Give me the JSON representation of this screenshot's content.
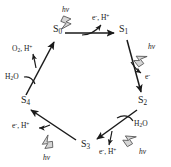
{
  "diagram": {
    "states": [
      {
        "id": "S0",
        "label": "S",
        "subscript": "0",
        "x": 53,
        "y": 30
      },
      {
        "id": "S1",
        "label": "S",
        "subscript": "1",
        "x": 119,
        "y": 30
      },
      {
        "id": "S2",
        "label": "S",
        "subscript": "2",
        "x": 138,
        "y": 100
      },
      {
        "id": "S3",
        "label": "S",
        "subscript": "3",
        "x": 81,
        "y": 142
      },
      {
        "id": "S4",
        "label": "S",
        "subscript": "4",
        "x": 21,
        "y": 100
      }
    ],
    "species": [
      {
        "id": "products-s0-s1",
        "text": "e⁻, H⁺",
        "base": "e",
        "sup1": "-",
        "mid": ", H",
        "sup2": "+",
        "x": 92,
        "y": 18
      },
      {
        "id": "product-s1-s2",
        "text": "e⁻",
        "base": "e",
        "sup1": "-",
        "mid": "",
        "sup2": "",
        "x": 143,
        "y": 77
      },
      {
        "id": "substrate-s2",
        "text": "H₂O",
        "base": "H",
        "sub1": "2",
        "mid": "O",
        "x": 134,
        "y": 124
      },
      {
        "id": "products-s2-s3",
        "text": "e⁻, H⁺",
        "base": "e",
        "sup1": "-",
        "mid": ", H",
        "sup2": "+",
        "x": 99,
        "y": 151
      },
      {
        "id": "products-s3-s4",
        "text": "e⁻, H⁺",
        "base": "e",
        "sup1": "-",
        "mid": ", H",
        "sup2": "+",
        "x": 12,
        "y": 126
      },
      {
        "id": "substrate-s4",
        "text": "H₂O",
        "base": "H",
        "sub1": "2",
        "mid": "O",
        "x": 5,
        "y": 76
      },
      {
        "id": "products-s4-s0",
        "text": "O₂, H⁺",
        "base": "O",
        "sub1": "2",
        "mid": ", H",
        "sup2": "+",
        "x": 12,
        "y": 49
      }
    ],
    "photons": [
      {
        "id": "photon-s0-s1",
        "text": "hν",
        "x": 62,
        "y": 9
      },
      {
        "id": "photon-s1-s2",
        "text": "hν",
        "x": 148,
        "y": 46
      },
      {
        "id": "photon-s2-s3",
        "text": "hν",
        "x": 139,
        "y": 151
      },
      {
        "id": "photon-s3-s4",
        "text": "hν",
        "x": 43,
        "y": 157
      }
    ],
    "transitions": [
      {
        "id": "s0-to-s1",
        "from": "S0",
        "to": "S1"
      },
      {
        "id": "s1-to-s2",
        "from": "S1",
        "to": "S2"
      },
      {
        "id": "s2-to-s3",
        "from": "S2",
        "to": "S3"
      },
      {
        "id": "s3-to-s4",
        "from": "S3",
        "to": "S4"
      },
      {
        "id": "s4-to-s0",
        "from": "S4",
        "to": "S0"
      }
    ],
    "colors": {
      "stroke": "#1a1a1a",
      "text": "#1a1a1a",
      "photon_fill": "#d6d6d6",
      "photon_stroke": "#555555",
      "background": "#ffffff"
    }
  }
}
